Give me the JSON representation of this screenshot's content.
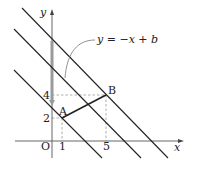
{
  "diagram": {
    "type": "coordinate-plane",
    "axes": {
      "x_label": "x",
      "y_label": "y",
      "origin_label": "O"
    },
    "ticks": {
      "x": [
        "1",
        "5"
      ],
      "y": [
        "2",
        "4"
      ]
    },
    "points": [
      {
        "label": "A",
        "x": 1,
        "y": 2
      },
      {
        "label": "B",
        "x": 5,
        "y": 4
      }
    ],
    "lines": [
      {
        "equation": "y = -x + 3",
        "b": 3
      },
      {
        "equation": "y = -x + 6",
        "b": 6
      },
      {
        "equation": "y = -x + 9",
        "b": 9
      }
    ],
    "annotation": "y = −x + b",
    "colors": {
      "line": "#222222",
      "dashed": "#888888",
      "arrow": "#999999"
    }
  }
}
